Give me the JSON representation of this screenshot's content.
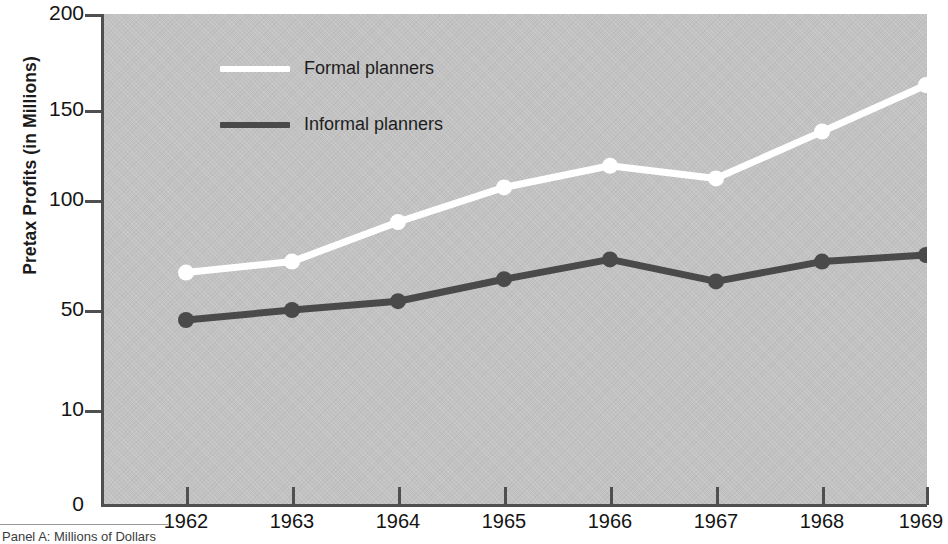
{
  "chart_data": {
    "type": "line",
    "title": "",
    "subtitle": "",
    "xlabel": "",
    "ylabel": "Pretax Profits (in Millions)",
    "x": [
      1962,
      1963,
      1964,
      1965,
      1966,
      1967,
      1968,
      1969
    ],
    "categories": [
      "1962",
      "1963",
      "1964",
      "1965",
      "1966",
      "1967",
      "1968",
      "1969"
    ],
    "series": [
      {
        "name": "Formal planners",
        "color": "#ffffff",
        "values": [
          67,
          72,
          90,
          107,
          119,
          112,
          138,
          163
        ]
      },
      {
        "name": "Informal planners",
        "color": "#4a4a4a",
        "values": [
          46,
          50,
          54,
          64,
          73,
          63,
          72,
          75
        ]
      }
    ],
    "ytick_labels": [
      "200",
      "150",
      "100",
      "50",
      "10",
      "0"
    ],
    "ytick_values": [
      200,
      150,
      100,
      50,
      10,
      0
    ],
    "ytick_pixel_y": [
      14,
      110,
      200,
      310,
      410,
      505
    ],
    "ylim": [
      0,
      200
    ],
    "xlim": [
      1962,
      1969
    ],
    "grid": false,
    "legend_position": "upper-left-inside",
    "plot_background": "#c2c2c2",
    "axis_color": "#4f4f4f",
    "note": "Y axis uses a non-uniform (broken) scale: 0, 10, 50, 100, 150, 200"
  },
  "legend": {
    "entries": [
      {
        "label": "Formal planners",
        "color": "#ffffff"
      },
      {
        "label": "Informal planners",
        "color": "#4a4a4a"
      }
    ]
  },
  "axes": {
    "y_title": "Pretax Profits (in Millions)",
    "y_ticks": [
      {
        "label": "200"
      },
      {
        "label": "150"
      },
      {
        "label": "100"
      },
      {
        "label": "50"
      },
      {
        "label": "10"
      },
      {
        "label": "0"
      }
    ],
    "x_ticks": [
      {
        "label": "1962"
      },
      {
        "label": "1963"
      },
      {
        "label": "1964"
      },
      {
        "label": "1965"
      },
      {
        "label": "1966"
      },
      {
        "label": "1967"
      },
      {
        "label": "1968"
      },
      {
        "label": "1969"
      }
    ]
  },
  "footer": {
    "caption": "Panel A: Millions of Dollars"
  }
}
